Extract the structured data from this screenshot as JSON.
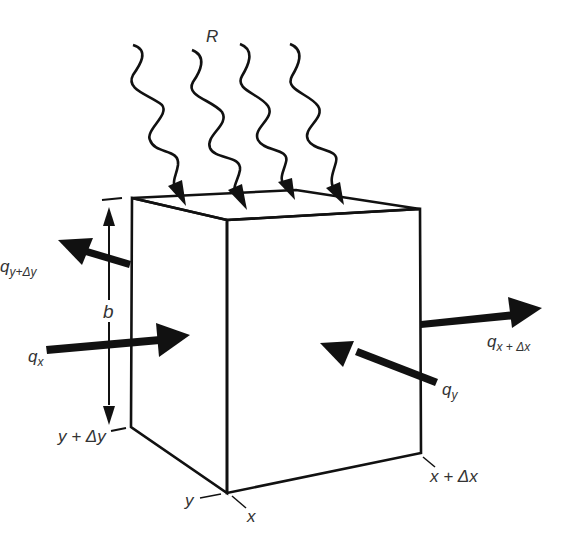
{
  "diagram": {
    "colors": {
      "stroke": "#111111",
      "text": "#333333",
      "background": "#ffffff"
    },
    "labels": {
      "R": "R",
      "b": "b",
      "qx_main": "q",
      "qx_sub": "x",
      "qxdx_main": "q",
      "qxdx_sub": "x + Δx",
      "qy_main": "q",
      "qy_sub": "y",
      "qydy_main": "q",
      "qydy_sub": "y+Δy",
      "y_dy": "y + Δy",
      "x_dx": "x + Δx",
      "y": "y",
      "x": "x"
    },
    "elements": [
      {
        "id": "radiation-arrows",
        "count": 4,
        "label": "R"
      },
      {
        "id": "flux-qx",
        "direction": "in",
        "face": "left"
      },
      {
        "id": "flux-qx+dx",
        "direction": "out",
        "face": "right"
      },
      {
        "id": "flux-qy",
        "direction": "in",
        "face": "front"
      },
      {
        "id": "flux-qy+dy",
        "direction": "out",
        "face": "back"
      },
      {
        "id": "dimension-b",
        "type": "height"
      }
    ]
  }
}
